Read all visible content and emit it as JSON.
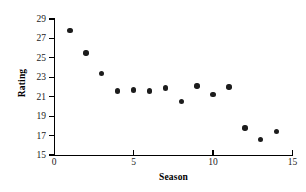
{
  "chart_data": {
    "type": "scatter",
    "title": "",
    "xlabel": "Season",
    "ylabel": "Rating",
    "xlim": [
      0,
      15
    ],
    "ylim": [
      15,
      29
    ],
    "xticks": [
      0,
      5,
      10,
      15
    ],
    "xtick_labels": [
      "0",
      "5",
      "10",
      "15"
    ],
    "yticks": [
      15,
      17,
      19,
      21,
      23,
      25,
      27,
      29
    ],
    "ytick_labels": [
      "15",
      "17",
      "19",
      "21",
      "23",
      "25",
      "27",
      "29"
    ],
    "grid": false,
    "legend": null,
    "marker": "filled-circle",
    "marker_color": "#1c1c1c",
    "x": [
      1,
      2,
      3,
      4,
      5,
      6,
      7,
      8,
      9,
      10,
      11,
      12,
      13,
      14
    ],
    "y": [
      27.8,
      25.5,
      23.4,
      21.6,
      21.7,
      21.6,
      21.9,
      20.5,
      22.1,
      21.2,
      22.0,
      17.8,
      16.6,
      17.4
    ],
    "points": [
      {
        "season": 1,
        "rating": 27.8
      },
      {
        "season": 2,
        "rating": 25.5
      },
      {
        "season": 3,
        "rating": 23.4
      },
      {
        "season": 4,
        "rating": 21.6
      },
      {
        "season": 5,
        "rating": 21.7
      },
      {
        "season": 6,
        "rating": 21.6
      },
      {
        "season": 7,
        "rating": 21.9
      },
      {
        "season": 8,
        "rating": 20.5
      },
      {
        "season": 9,
        "rating": 22.1
      },
      {
        "season": 10,
        "rating": 21.2
      },
      {
        "season": 11,
        "rating": 22.0
      },
      {
        "season": 12,
        "rating": 17.8
      },
      {
        "season": 13,
        "rating": 16.6
      },
      {
        "season": 14,
        "rating": 17.4
      }
    ]
  },
  "colors": {
    "axis": "#000000",
    "marker": "#1c1c1c",
    "background": "#ffffff",
    "tick_label": "#1a1a1a"
  }
}
